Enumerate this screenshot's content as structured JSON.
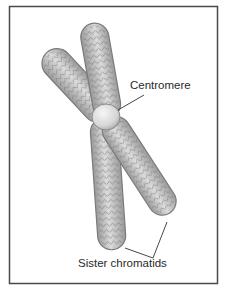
{
  "figure": {
    "labels": {
      "centromere": "Centromere",
      "sister_chromatids": "Sister chromatids"
    },
    "colors": {
      "frame": "#4a4a4a",
      "chromatid_fill": "#b8b8b8",
      "chromatid_edge": "#7a7a7a",
      "chromatid_highlight": "#e6e6e6",
      "centromere_fill": "#e2e2e2",
      "leader_line": "#333333",
      "background": "#ffffff"
    }
  }
}
